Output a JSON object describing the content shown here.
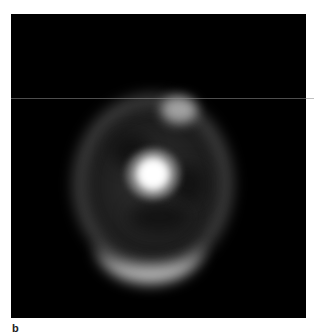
{
  "figure": {
    "panel_label": "b",
    "image": {
      "description": "Grayscale fluorescence/astronomical-style image: bright central core surrounded by a diffuse elliptical ring, brightest along the lower arc and an upper-right knot, on a black background",
      "background_color": "#000000",
      "core_color": "#ffffff",
      "ring_color": "#b0b0b0"
    }
  }
}
